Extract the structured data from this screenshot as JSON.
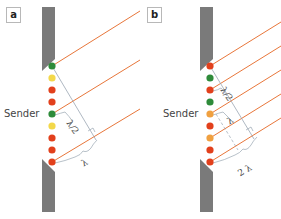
{
  "colors": {
    "wall": "#7a7a7a",
    "ray": "#e8763a",
    "guide": "#9aa6b2",
    "green": "#2e8b3a",
    "yellow": "#f3d84a",
    "red": "#e2401c",
    "orange": "#f0a040"
  },
  "panels": [
    {
      "id": "a",
      "label": "a",
      "sender_label": "Sender",
      "dots": [
        "green",
        "yellow",
        "red",
        "red",
        "green",
        "yellow",
        "red",
        "red",
        "red"
      ],
      "annotations": {
        "small": "λ/2",
        "large": "λ"
      }
    },
    {
      "id": "b",
      "label": "b",
      "sender_label": "Sender",
      "dots": [
        "red",
        "green",
        "red",
        "green",
        "orange",
        "red",
        "orange",
        "red",
        "red"
      ],
      "annotations": {
        "small": "λ/2",
        "mid": "λ",
        "large": "2 λ"
      }
    }
  ]
}
